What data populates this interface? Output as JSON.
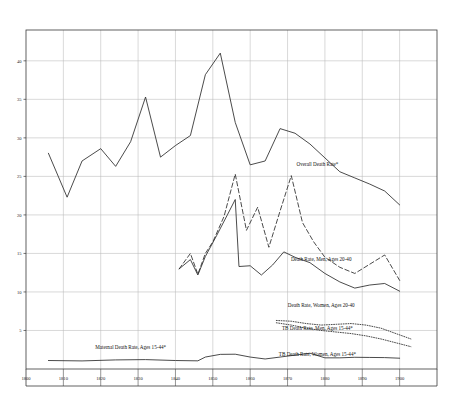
{
  "chart_data": {
    "type": "line",
    "title": "",
    "xlabel": "",
    "ylabel": "",
    "xlim": [
      1800,
      1910
    ],
    "ylim": [
      0,
      44
    ],
    "grid": true,
    "legend_position": "inline-right",
    "xticks": [
      1800,
      1810,
      1820,
      1830,
      1840,
      1850,
      1860,
      1870,
      1880,
      1890,
      1900
    ],
    "xtick_labels": [
      "1800",
      "1810",
      "1820",
      "1830",
      "1840",
      "1850",
      "1860",
      "1870",
      "1880",
      "1890",
      "1900"
    ],
    "yticks": [
      5,
      10,
      15,
      20,
      25,
      30,
      35,
      40
    ],
    "ytick_labels": [
      "5",
      "10",
      "15",
      "20",
      "25",
      "30",
      "35",
      "40"
    ],
    "footnote_marker": "*",
    "series": [
      {
        "name": "Overall Death Rate*",
        "label": "Overall Death Rate*",
        "style": "solid",
        "label_x": 1878,
        "label_y": 26.4,
        "x": [
          1806,
          1811,
          1815,
          1820,
          1824,
          1828,
          1832,
          1836,
          1840,
          1844,
          1848,
          1852,
          1856,
          1860,
          1864,
          1868,
          1872,
          1876,
          1880,
          1884,
          1888,
          1892,
          1896,
          1900
        ],
        "y": [
          28.0,
          22.3,
          27.0,
          28.6,
          26.3,
          29.5,
          35.3,
          27.5,
          29.0,
          30.3,
          38.2,
          41.0,
          32.0,
          26.5,
          27.0,
          31.2,
          30.6,
          29.2,
          27.4,
          25.6,
          24.8,
          24.0,
          23.1,
          21.3
        ]
      },
      {
        "name": "Death Rate, Men, Ages 20-40",
        "label": "Death Rate, Men, Ages 20-40",
        "style": "dashed",
        "label_x": 1879,
        "label_y": 14.0,
        "x": [
          1841,
          1844,
          1846,
          1848,
          1850,
          1853,
          1856,
          1859,
          1862,
          1865,
          1868,
          1871,
          1874,
          1877,
          1880,
          1884,
          1888,
          1892,
          1896,
          1900
        ],
        "y": [
          13.0,
          15.0,
          12.3,
          15.0,
          16.5,
          19.8,
          25.3,
          18.0,
          21.0,
          15.8,
          20.5,
          25.1,
          19.0,
          16.5,
          14.5,
          13.2,
          12.4,
          13.6,
          14.8,
          11.5
        ]
      },
      {
        "name": "Death Rate, Women, Ages 20-40",
        "label": "Death Rate, Women, Ages 20-40",
        "style": "solid",
        "label_x": 1879,
        "label_y": 8.1,
        "x": [
          1841,
          1844,
          1846,
          1848,
          1851,
          1854,
          1856,
          1857,
          1860,
          1863,
          1866,
          1869,
          1872,
          1876,
          1880,
          1884,
          1888,
          1892,
          1896,
          1900
        ],
        "y": [
          13.0,
          14.2,
          12.2,
          14.6,
          17.3,
          20.1,
          22.0,
          13.3,
          13.4,
          12.2,
          13.5,
          15.2,
          14.5,
          13.8,
          12.4,
          11.3,
          10.5,
          10.9,
          11.1,
          10.1
        ]
      },
      {
        "name": "TB Death Rate, Men, Ages 15-44*",
        "label": "TB Death Rate, Men, Ages 15-44*",
        "style": "dotted",
        "label_x": 1878,
        "label_y": 5.0,
        "x": [
          1867,
          1871,
          1875,
          1879,
          1883,
          1887,
          1891,
          1895,
          1899,
          1903
        ],
        "y": [
          6.3,
          6.2,
          5.9,
          5.7,
          5.8,
          5.9,
          5.7,
          5.3,
          4.6,
          3.9
        ]
      },
      {
        "name": "TB Death Rate, Women, Ages 15-44*",
        "label": "TB Death Rate, Women, Ages 15-44*",
        "style": "dotted",
        "label_x": 1878,
        "label_y": 1.7,
        "x": [
          1867,
          1871,
          1875,
          1879,
          1883,
          1887,
          1891,
          1895,
          1899,
          1903
        ],
        "y": [
          6.0,
          5.7,
          5.3,
          5.0,
          4.8,
          4.6,
          4.3,
          3.9,
          3.4,
          2.9
        ]
      },
      {
        "name": "Maternal Death Rate, Ages 15-44*",
        "label": "Maternal Death Rate, Ages 15-44*",
        "style": "solid",
        "label_x": 1828,
        "label_y": 2.6,
        "x": [
          1806,
          1815,
          1824,
          1832,
          1840,
          1846,
          1848,
          1852,
          1856,
          1860,
          1864,
          1868,
          1872,
          1876,
          1880,
          1884,
          1888,
          1892,
          1896,
          1900
        ],
        "y": [
          1.1,
          1.05,
          1.18,
          1.22,
          1.1,
          1.06,
          1.55,
          1.9,
          1.92,
          1.55,
          1.3,
          1.55,
          1.8,
          2.05,
          1.45,
          1.45,
          1.52,
          1.5,
          1.48,
          1.4
        ]
      }
    ]
  },
  "colors": {
    "axis": "#3a3a3a",
    "grid": "#b9b9b9",
    "line": "#2b2b2b",
    "background": "#ffffff"
  }
}
